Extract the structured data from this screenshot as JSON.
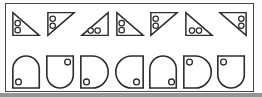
{
  "figure": {
    "name": "shape-pattern-puzzle",
    "page_background": "#fcfcfc",
    "frame": {
      "border_color": "#474747",
      "background": "#ffffff"
    },
    "stroke_color": "#2d2d2d",
    "dot_fill": "#ffffff",
    "bottom_shadow_color": "#959595",
    "rows": [
      {
        "name": "triangles-row",
        "shape_type": "right-triangle",
        "items": [
          {
            "right_angle": "bottom-left",
            "dots_edge": "left",
            "dot_count": 2
          },
          {
            "right_angle": "top-left",
            "dots_edge": "left",
            "dot_count": 2
          },
          {
            "right_angle": "bottom-right",
            "dots_edge": "bottom",
            "dot_count": 2
          },
          {
            "right_angle": "bottom-left",
            "dots_edge": "left",
            "dot_count": 2
          },
          {
            "right_angle": "top-left",
            "dots_edge": "left",
            "dot_count": 2
          },
          {
            "right_angle": "bottom-left",
            "dots_edge": "bottom",
            "dot_count": 2
          },
          {
            "right_angle": "top-right",
            "dots_edge": "right",
            "dot_count": 2
          }
        ]
      },
      {
        "name": "rounded-shapes-row",
        "shape_type": "square-with-one-rounded-side",
        "items": [
          {
            "curve_side": "top",
            "dot_corner": "bottom-left",
            "dot_count": 1
          },
          {
            "curve_side": "bottom",
            "dot_corner": "top-right",
            "dot_count": 1
          },
          {
            "curve_side": "right",
            "dot_corner": "bottom-left",
            "dot_count": 1
          },
          {
            "curve_side": "left",
            "dot_corner": "bottom-right",
            "dot_count": 1
          },
          {
            "curve_side": "top",
            "dot_corner": "bottom-right",
            "dot_count": 1
          },
          {
            "curve_side": "right",
            "dot_corner": "top-left",
            "dot_count": 1
          },
          {
            "curve_side": "bottom",
            "dot_corner": "top-left",
            "dot_count": 1
          }
        ]
      }
    ]
  }
}
